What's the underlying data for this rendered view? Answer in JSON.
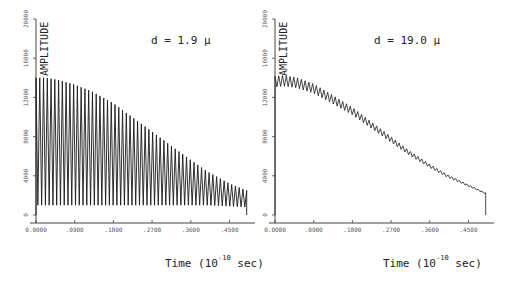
{
  "chart_data": [
    {
      "type": "line",
      "title": "",
      "annotation": "d = 1.9 μ",
      "ylabel": "AMPLITUDE",
      "xlabel": "Time (10^-10 sec)",
      "xlabel_parts": {
        "prefix": "Time (10",
        "exp": "-10",
        "suffix": " sec)"
      },
      "x_ticks": [
        "0.0000",
        ".0900",
        ".1800",
        ".2700",
        ".3600",
        ".4500"
      ],
      "y_ticks": [
        "0",
        "4000",
        "8000",
        "12000",
        "16000",
        "20000"
      ],
      "xlim": [
        0,
        0.5
      ],
      "ylim": [
        0,
        20000
      ],
      "grid": false,
      "description": "Rapid oscillation (~55 cycles) between near-zero troughs and a decaying upper envelope",
      "envelope": {
        "x": [
          0.0,
          0.02,
          0.05,
          0.09,
          0.13,
          0.18,
          0.22,
          0.27,
          0.31,
          0.36,
          0.4,
          0.45,
          0.49
        ],
        "upper": [
          14000,
          14000,
          13800,
          13300,
          12600,
          11400,
          10100,
          8500,
          7200,
          5600,
          4400,
          3200,
          2500
        ],
        "lower": [
          1000,
          1000,
          1000,
          1000,
          1000,
          1000,
          1000,
          1000,
          1000,
          1000,
          1000,
          900,
          800
        ]
      },
      "cycles": 56,
      "end_x": 0.49
    },
    {
      "type": "line",
      "title": "",
      "annotation": "d = 19.0 μ",
      "ylabel": "AMPLITUDE",
      "xlabel": "Time (10^-10 sec)",
      "xlabel_parts": {
        "prefix": "Time (10",
        "exp": "-10",
        "suffix": " sec)"
      },
      "x_ticks": [
        "0.0000",
        ".0900",
        ".1800",
        ".2700",
        ".3600",
        ".4500"
      ],
      "y_ticks": [
        "0",
        "4000",
        "8000",
        "12000",
        "16000",
        "20000"
      ],
      "xlim": [
        0,
        0.5
      ],
      "ylim": [
        0,
        20000
      ],
      "grid": false,
      "description": "Small-amplitude oscillation riding on a smoothly decaying mean, ends with vertical drop to 0",
      "envelope": {
        "x": [
          0.0,
          0.02,
          0.05,
          0.09,
          0.13,
          0.18,
          0.22,
          0.27,
          0.31,
          0.36,
          0.4,
          0.45,
          0.49
        ],
        "mean": [
          13600,
          13700,
          13500,
          12900,
          11900,
          10600,
          9300,
          7700,
          6400,
          5000,
          4000,
          3000,
          2200
        ],
        "half_amplitude": [
          550,
          550,
          520,
          480,
          430,
          380,
          330,
          280,
          230,
          180,
          140,
          100,
          70
        ]
      },
      "cycles": 56,
      "end_x": 0.49
    }
  ],
  "panels": [
    {
      "annotation": "d = 1.9 μ",
      "ylabel": "AMPLITUDE",
      "xtitle_prefix": "Time (10",
      "xtitle_exp": "-10",
      "xtitle_suffix": "sec)"
    },
    {
      "annotation": "d = 19.0 μ",
      "ylabel": "AMPLITUDE",
      "xtitle_prefix": "Time (10",
      "xtitle_exp": "-10",
      "xtitle_suffix": "sec)"
    }
  ]
}
